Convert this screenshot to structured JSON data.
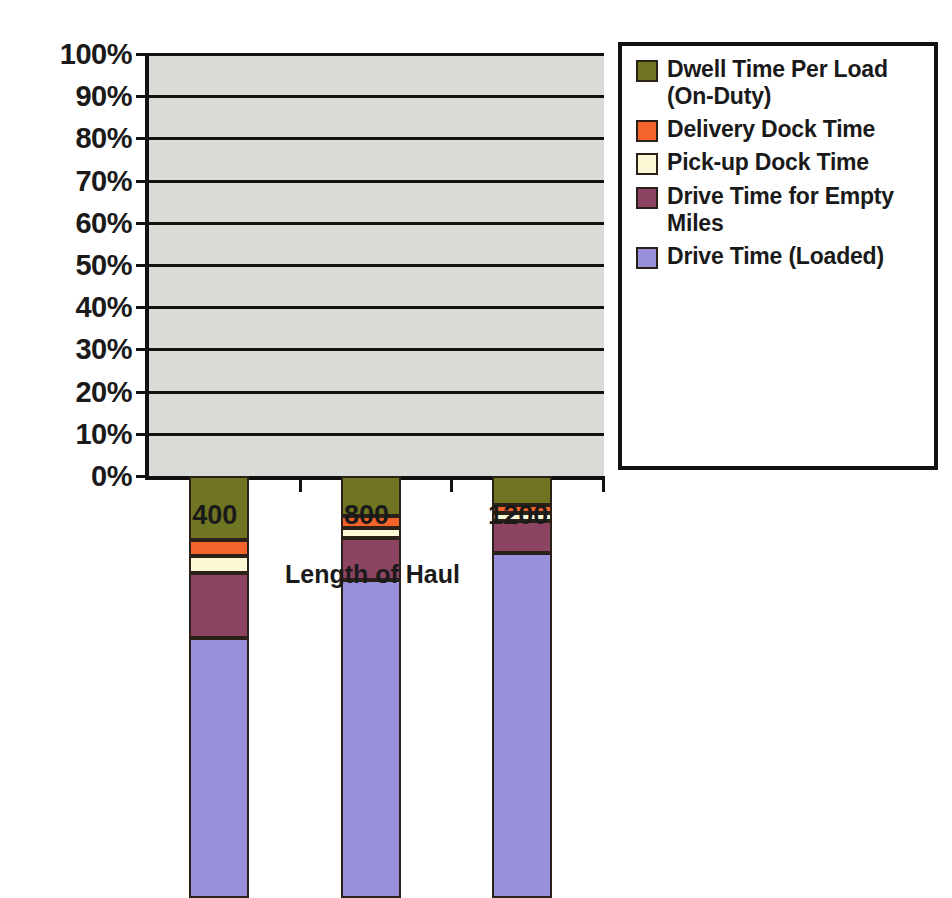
{
  "chart_data": {
    "type": "bar",
    "subtype": "stacked-100-percent",
    "title": "",
    "xlabel": "Length of Haul",
    "ylabel": "",
    "categories": [
      "400",
      "800",
      "1200"
    ],
    "ylim": [
      0,
      100
    ],
    "y_ticks": [
      "0%",
      "10%",
      "20%",
      "30%",
      "40%",
      "50%",
      "60%",
      "70%",
      "80%",
      "90%",
      "100%"
    ],
    "y_tick_values": [
      0,
      10,
      20,
      30,
      40,
      50,
      60,
      70,
      80,
      90,
      100
    ],
    "grid": true,
    "legend_position": "right",
    "stack_order_bottom_to_top": [
      "Drive Time (Loaded)",
      "Drive Time for Empty Miles",
      "Pick-up Dock Time",
      "Delivery Dock Time",
      "Dwell Time Per Load (On-Duty)"
    ],
    "series": [
      {
        "name": "Drive Time (Loaded)",
        "color": "#9890db",
        "values": [
          61.5,
          75.4,
          81.8
        ]
      },
      {
        "name": "Drive Time for Empty Miles",
        "color": "#8d4462",
        "values": [
          15.5,
          9.9,
          7.5
        ]
      },
      {
        "name": "Pick-up Dock Time",
        "color": "#fbf8d5",
        "values": [
          4.0,
          2.4,
          1.9
        ]
      },
      {
        "name": "Delivery Dock Time",
        "color": "#f4642a",
        "values": [
          3.8,
          2.8,
          1.9
        ]
      },
      {
        "name": "Dwell Time Per Load (On-Duty)",
        "color": "#6f7520",
        "values": [
          15.2,
          9.5,
          6.9
        ]
      }
    ],
    "cumulative_tops": [
      [
        61.5,
        77.0,
        81.0,
        84.8,
        100.0
      ],
      [
        75.4,
        85.3,
        87.7,
        90.5,
        100.0
      ],
      [
        81.8,
        89.3,
        91.2,
        93.1,
        100.0
      ]
    ]
  },
  "legend": {
    "items": [
      {
        "label": "Dwell Time Per Load (On-Duty)",
        "color": "#6f7520"
      },
      {
        "label": "Delivery Dock Time",
        "color": "#f4642a"
      },
      {
        "label": "Pick-up Dock Time",
        "color": "#fbf8d5"
      },
      {
        "label": "Drive Time for Empty Miles",
        "color": "#8d4462"
      },
      {
        "label": "Drive Time (Loaded)",
        "color": "#9890db"
      }
    ]
  },
  "style": {
    "plot_background": "#d9dcd6",
    "axis_color": "#111111",
    "segment_outline": "#2b2118",
    "page_background": "#ffffff"
  }
}
